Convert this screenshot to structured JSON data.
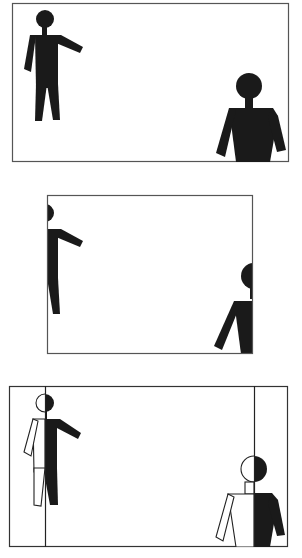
{
  "diagram": {
    "colors": {
      "frame": "#555555",
      "figure": "#1a1a1a",
      "background": "#ffffff",
      "outline": "#222222"
    },
    "panels": [
      {
        "id": "wide-frame",
        "frame": {
          "x": 12,
          "y": 3,
          "w": 277,
          "h": 159
        },
        "figures": [
          "left-person-pointing",
          "right-person-large"
        ]
      },
      {
        "id": "cropped-frame",
        "frame": {
          "x": 47,
          "y": 195,
          "w": 206,
          "h": 159
        },
        "figures": [
          "left-person-half-visible",
          "right-person-half-visible"
        ]
      },
      {
        "id": "overlay-comparison",
        "frame": {
          "x": 9,
          "y": 386,
          "w": 279,
          "h": 161
        },
        "crop_lines_x": [
          45,
          254
        ],
        "figures": [
          "left-person-split",
          "right-person-split"
        ]
      }
    ]
  }
}
